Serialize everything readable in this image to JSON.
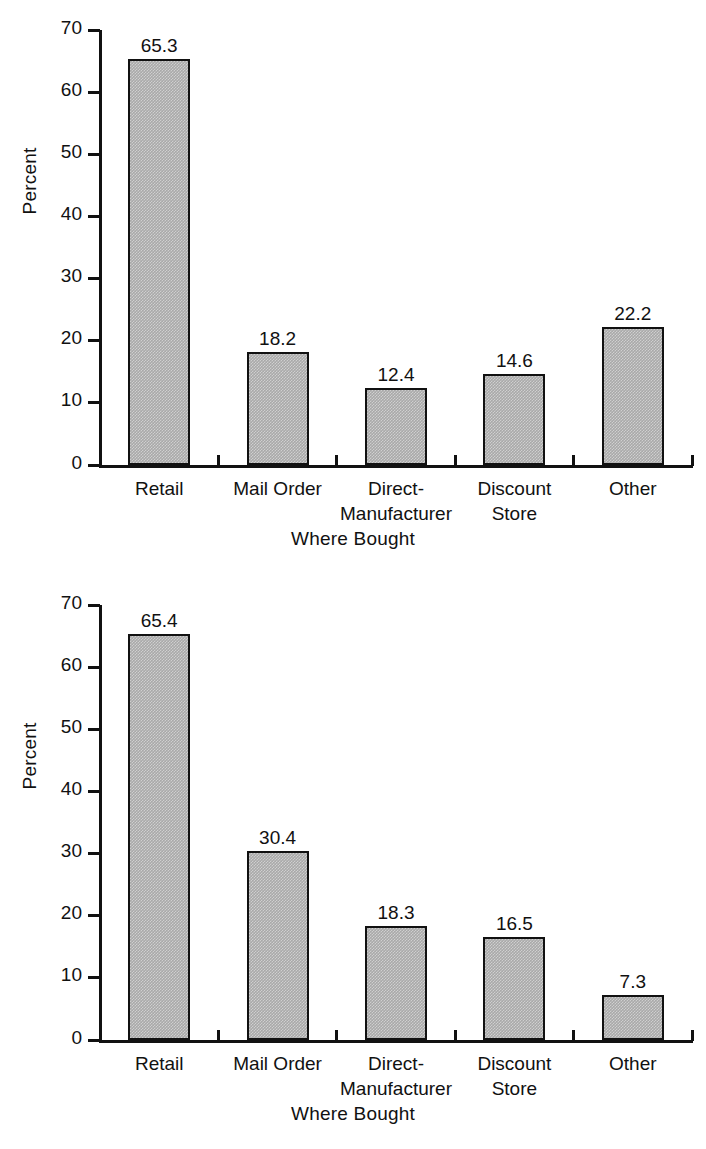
{
  "figures": [
    {
      "id": "chart-top",
      "chart": {
        "type": "bar",
        "title": "",
        "xlabel": "Where Bought",
        "ylabel": "Percent",
        "ylim": [
          0,
          70
        ],
        "yticks": [
          0,
          10,
          20,
          30,
          40,
          50,
          60,
          70
        ],
        "ytick_labels": [
          "0",
          "10",
          "20",
          "30",
          "40",
          "50",
          "60",
          "70"
        ],
        "grid": false,
        "legend": "none",
        "categories": [
          "Retail",
          "Mail Order",
          "Direct-\nManufacturer",
          "Discount\nStore",
          "Other"
        ],
        "values": [
          65.3,
          18.2,
          12.4,
          14.6,
          22.2
        ],
        "value_labels": [
          "65.3",
          "18.2",
          "12.4",
          "14.6",
          "22.2"
        ],
        "bar_color": "#a9a9a9",
        "bar_edge_color": "#111111"
      }
    },
    {
      "id": "chart-bottom",
      "chart": {
        "type": "bar",
        "title": "",
        "xlabel": "Where Bought",
        "ylabel": "Percent",
        "ylim": [
          0,
          70
        ],
        "yticks": [
          0,
          10,
          20,
          30,
          40,
          50,
          60,
          70
        ],
        "ytick_labels": [
          "0",
          "10",
          "20",
          "30",
          "40",
          "50",
          "60",
          "70"
        ],
        "grid": false,
        "legend": "none",
        "categories": [
          "Retail",
          "Mail Order",
          "Direct-\nManufacturer",
          "Discount\nStore",
          "Other"
        ],
        "values": [
          65.4,
          30.4,
          18.3,
          16.5,
          7.3
        ],
        "value_labels": [
          "65.4",
          "30.4",
          "18.3",
          "16.5",
          "7.3"
        ],
        "bar_color": "#a9a9a9",
        "bar_edge_color": "#111111"
      }
    }
  ],
  "chart_data": [
    {
      "type": "bar",
      "title": "",
      "xlabel": "Where Bought",
      "ylabel": "Percent",
      "ylim": [
        0,
        70
      ],
      "yticks": [
        0,
        10,
        20,
        30,
        40,
        50,
        60,
        70
      ],
      "grid": false,
      "categories": [
        "Retail",
        "Mail Order",
        "Direct-Manufacturer",
        "Discount Store",
        "Other"
      ],
      "values": [
        65.3,
        18.2,
        12.4,
        14.6,
        22.2
      ]
    },
    {
      "type": "bar",
      "title": "",
      "xlabel": "Where Bought",
      "ylabel": "Percent",
      "ylim": [
        0,
        70
      ],
      "yticks": [
        0,
        10,
        20,
        30,
        40,
        50,
        60,
        70
      ],
      "grid": false,
      "categories": [
        "Retail",
        "Mail Order",
        "Direct-Manufacturer",
        "Discount Store",
        "Other"
      ],
      "values": [
        65.4,
        30.4,
        18.3,
        16.5,
        7.3
      ]
    }
  ]
}
